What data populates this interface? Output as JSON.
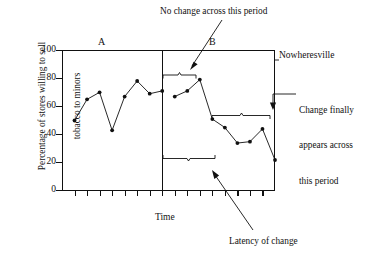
{
  "chart_data": {
    "type": "line",
    "title": "",
    "subtitle": "",
    "xlabel": "Time",
    "ylabel": "Percentage of stores willing to sell tobacco to minors",
    "ylim": [
      0,
      100
    ],
    "yticks": [
      0,
      20,
      40,
      60,
      80,
      100
    ],
    "ytick_labels": [
      "0",
      "20",
      "40",
      "60",
      "80",
      "100"
    ],
    "xticks_count": 16,
    "xtick_labels": [],
    "grid": false,
    "legend": false,
    "legend_position": "none",
    "series": [
      {
        "name": "Phase A",
        "phase": "A",
        "x": [
          1,
          2,
          3,
          4,
          5,
          6,
          7,
          8
        ],
        "values": [
          50,
          65,
          70,
          43,
          67,
          78,
          69,
          71
        ]
      },
      {
        "name": "Phase B",
        "phase": "B",
        "x": [
          9,
          10,
          11,
          12,
          13,
          14,
          15,
          16,
          17
        ],
        "values": [
          67,
          71,
          79,
          51,
          45,
          34,
          35,
          44,
          22
        ]
      }
    ],
    "phase_labels": [
      "A",
      "B"
    ],
    "phase_change_line_at_x": 8.5,
    "annotations": [
      {
        "name": "no-change",
        "text": "No change across this period",
        "points_to": "phase B upper bracket"
      },
      {
        "name": "change-appears",
        "text": "Change finally appears across this period",
        "points_to": "phase B lower-right bracket"
      },
      {
        "name": "latency",
        "text": "Latency of change",
        "points_to": "phase B latency bracket"
      },
      {
        "name": "condition",
        "text": "Nowheresville",
        "points_to": "top right of plot"
      }
    ],
    "brackets": [
      {
        "name": "no-change-bracket",
        "orientation": "up",
        "x_from": 163,
        "x_to": 196,
        "level": 81
      },
      {
        "name": "latency-bracket",
        "orientation": "down",
        "x_from": 163,
        "x_to": 215,
        "level": 27
      },
      {
        "name": "change-bracket",
        "orientation": "up",
        "x_from": 212,
        "x_to": 272,
        "level": 54
      }
    ]
  },
  "labels": {
    "phase_a": "A",
    "phase_b": "B",
    "time": "Time",
    "condition": "Nowheresville",
    "y_axis_line1": "Percentage of stores willing to sell",
    "y_axis_line2": "tobacco to minors",
    "ann_no_change": "No change across this period",
    "ann_change_line1": "Change finally",
    "ann_change_line2": "appears across",
    "ann_change_line3": "this period",
    "ann_latency": "Latency of change"
  },
  "ytick_labels": {
    "t0": "0",
    "t20": "20",
    "t40": "40",
    "t60": "60",
    "t80": "80",
    "t100": "100"
  },
  "colors": {
    "ink": "#111111",
    "background": "#ffffff",
    "line": "#111111",
    "marker": "#111111"
  }
}
